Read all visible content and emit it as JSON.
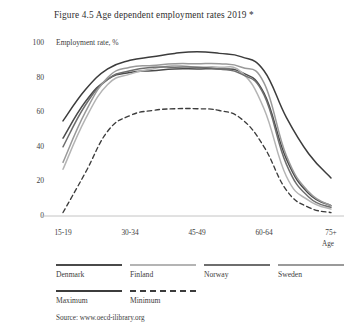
{
  "figure": {
    "title": "Figure 4.5  Age dependent employment rates 2019 *",
    "source": "Source: www.oecd-ilibrary.org",
    "axis_note": "Employment rate, %",
    "xaxis_name": "Age"
  },
  "legend": {
    "items": [
      {
        "label": "Denmark",
        "color": "#4a4a4a",
        "style": "solid"
      },
      {
        "label": "Finland",
        "color": "#b4b4b4",
        "style": "solid"
      },
      {
        "label": "Norway",
        "color": "#6e6e6e",
        "style": "solid"
      },
      {
        "label": "Sweden",
        "color": "#9a9a9a",
        "style": "solid"
      },
      {
        "label": "Maximum",
        "color": "#3c3c3c",
        "style": "solid"
      },
      {
        "label": "Minimum",
        "color": "#3c3c3c",
        "style": "dashed"
      }
    ]
  },
  "chart_data": {
    "type": "line",
    "title": "Figure 4.5  Age dependent employment rates 2019 *",
    "subtitle": "Employment rate, %",
    "xlabel": "Age",
    "ylabel": "Employment rate, %",
    "ylim": [
      0,
      100
    ],
    "yticks": [
      0,
      20,
      40,
      60,
      80,
      100
    ],
    "grid": false,
    "legend_position": "below",
    "categories": [
      "15-19",
      "20-24",
      "25-29",
      "30-34",
      "35-39",
      "40-44",
      "45-49",
      "50-54",
      "55-59",
      "60-64",
      "65-69",
      "70-74",
      "75+"
    ],
    "tick_labels": [
      "15-19",
      "30-34",
      "45-49",
      "60-64",
      "75+"
    ],
    "tick_indices": [
      0,
      3,
      6,
      9,
      12
    ],
    "series": [
      {
        "name": "Denmark",
        "color": "#4a4a4a",
        "style": "solid",
        "values": [
          45,
          66,
          79,
          83,
          84,
          85,
          85,
          85,
          83,
          71,
          33,
          13,
          6
        ]
      },
      {
        "name": "Finland",
        "color": "#b4b4b4",
        "style": "solid",
        "values": [
          27,
          56,
          76,
          82,
          85,
          87,
          86,
          86,
          83,
          62,
          23,
          9,
          4
        ]
      },
      {
        "name": "Norway",
        "color": "#6e6e6e",
        "style": "solid",
        "values": [
          40,
          64,
          79,
          84,
          86,
          86,
          86,
          85,
          82,
          70,
          30,
          11,
          5
        ]
      },
      {
        "name": "Sweden",
        "color": "#9a9a9a",
        "style": "solid",
        "values": [
          31,
          60,
          80,
          86,
          87,
          88,
          88,
          88,
          86,
          77,
          35,
          14,
          6
        ]
      },
      {
        "name": "Maximum",
        "color": "#3c3c3c",
        "style": "solid",
        "values": [
          55,
          73,
          85,
          90,
          92,
          94,
          95,
          94,
          92,
          84,
          57,
          36,
          22
        ]
      },
      {
        "name": "Minimum",
        "color": "#3c3c3c",
        "style": "dashed",
        "values": [
          2,
          25,
          49,
          58,
          61,
          62,
          62,
          61,
          56,
          40,
          15,
          5,
          2
        ]
      }
    ]
  }
}
